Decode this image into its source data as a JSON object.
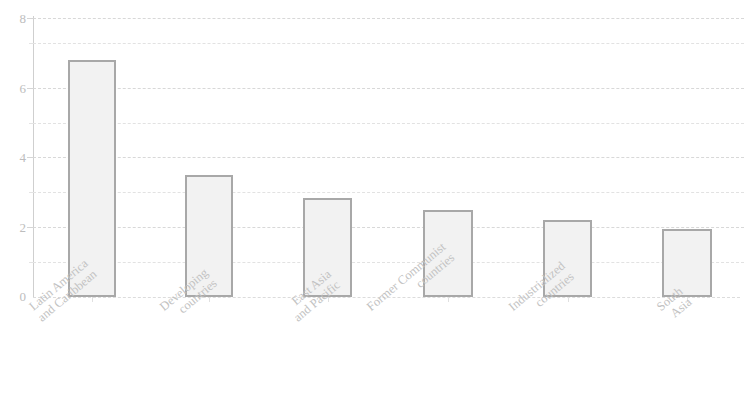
{
  "chart_data": {
    "type": "bar",
    "title": "",
    "subtitle": "",
    "xlabel": "",
    "ylabel": "",
    "ylim": [
      0,
      8
    ],
    "yticks": [
      0,
      2,
      4,
      6,
      8
    ],
    "yticklabels": [
      "0",
      "2",
      "4",
      "6",
      "8"
    ],
    "y_minor_ticks": [
      1,
      3,
      5,
      7
    ],
    "grid": true,
    "grid_axis": "y",
    "legend": false,
    "legend_position": "none",
    "categories": [
      "Latin America and Caribbean",
      "Developing countries",
      "East Asia and Pacific",
      "Former Communist countries",
      "Industrialized countries",
      "South Asia"
    ],
    "values": [
      6.8,
      3.5,
      2.85,
      2.5,
      2.2,
      1.95
    ],
    "bar_facecolor": "#f2f2f2",
    "bar_edgecolor": "#a8a8a8",
    "axis_color": "#cfcfcf",
    "grid_color": "#e2e2e2",
    "text_color": "#bdbdbd"
  },
  "axes": {
    "y_labels": [
      {
        "text": "8",
        "value": 8
      },
      {
        "text": "6",
        "value": 6
      },
      {
        "text": "4",
        "value": 4
      },
      {
        "text": "2",
        "value": 2
      },
      {
        "text": "0",
        "value": 0
      }
    ],
    "x_labels": [
      {
        "line1": "Latin America",
        "line2": "and Caribbean"
      },
      {
        "line1": "Developing",
        "line2": "countries"
      },
      {
        "line1": "East Asia",
        "line2": "and Pacific"
      },
      {
        "line1": "Former Communist",
        "line2": "countries"
      },
      {
        "line1": "Industrialized",
        "line2": "countries"
      },
      {
        "line1": "South",
        "line2": "Asia"
      }
    ]
  }
}
